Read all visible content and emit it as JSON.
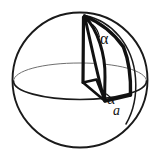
{
  "figure": {
    "kind": "geometry-diagram",
    "canvas": {
      "width": 160,
      "height": 160,
      "background": "#ffffff"
    },
    "colors": {
      "ink": "#111111",
      "outline": "#1a1a1a",
      "hidden_line": "#6f6f6f",
      "fill": "#ffffff"
    },
    "labels": {
      "alpha_top": "α",
      "alpha_bottom": "α",
      "edge_a": "a"
    },
    "parts": {
      "sphere_outline": "sphere-outline-circle",
      "equator_front": "equator-front-arc",
      "equator_back": "equator-back-arc",
      "meridian_arc": "meridian-arc",
      "lune_face": "spherical-wedge-face",
      "axis": "polar-axis-line",
      "base_face": "wedge-base-face"
    },
    "geometry": {
      "sphere_center": [
        80,
        80
      ],
      "sphere_radius": 68,
      "equator_rx": 66,
      "equator_ry": 19,
      "north_pole": [
        84,
        16
      ],
      "base_point": [
        105,
        101
      ]
    }
  }
}
